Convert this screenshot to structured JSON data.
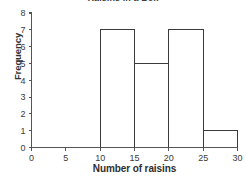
{
  "chart_data": {
    "type": "bar",
    "title": "Raisins in a Box",
    "title_note": "title is cropped off the top edge of the screenshot and is not legible",
    "xlabel": "Number of raisins",
    "ylabel": "Frequency",
    "xlim": [
      0,
      30
    ],
    "ylim": [
      0,
      8
    ],
    "xticks": [
      0,
      5,
      10,
      15,
      20,
      25,
      30
    ],
    "yticks": [
      0,
      1,
      2,
      3,
      4,
      5,
      6,
      7,
      8
    ],
    "xtick_labels": [
      "0",
      "5",
      "10",
      "15",
      "20",
      "25",
      "30"
    ],
    "ytick_labels": [
      "0",
      "1",
      "2",
      "3",
      "4",
      "5",
      "6",
      "7",
      "8"
    ],
    "grid": false,
    "legend": false,
    "bin_width": 5,
    "bin_edges": [
      0,
      5,
      10,
      15,
      20,
      25,
      30
    ],
    "categories": [
      "0-5",
      "5-10",
      "10-15",
      "15-20",
      "20-25",
      "25-30"
    ],
    "values": [
      0,
      0,
      7,
      5,
      7,
      1
    ],
    "bars": [
      {
        "bin_start": 0,
        "bin_end": 5,
        "frequency": 0
      },
      {
        "bin_start": 5,
        "bin_end": 10,
        "frequency": 0
      },
      {
        "bin_start": 10,
        "bin_end": 15,
        "frequency": 7
      },
      {
        "bin_start": 15,
        "bin_end": 20,
        "frequency": 5
      },
      {
        "bin_start": 20,
        "bin_end": 25,
        "frequency": 7
      },
      {
        "bin_start": 25,
        "bin_end": 30,
        "frequency": 1
      }
    ],
    "colors": {
      "bar_fill": "#ffffff",
      "bar_stroke": "#3a3a3a",
      "axis": "#555555",
      "text": "#2e2e2e",
      "background": "#ffffff"
    }
  }
}
